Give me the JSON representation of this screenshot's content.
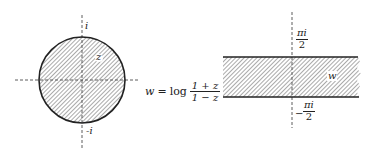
{
  "z_plane": {
    "region_label": "z",
    "top_label": "i",
    "bottom_label": "-i",
    "region": "unit disk (shaded)"
  },
  "mapping": {
    "lhs": "w",
    "equals": "=",
    "func": "log",
    "numerator": "1 + z",
    "denominator": "1 − z"
  },
  "w_plane": {
    "region_label": "w",
    "top_label_num": "πi",
    "top_label_den": "2",
    "bottom_label_sign": "−",
    "bottom_label_num": "πi",
    "bottom_label_den": "2",
    "region": "horizontal strip (shaded)"
  },
  "colors": {
    "ink": "#222222",
    "hatch": "#555555"
  }
}
